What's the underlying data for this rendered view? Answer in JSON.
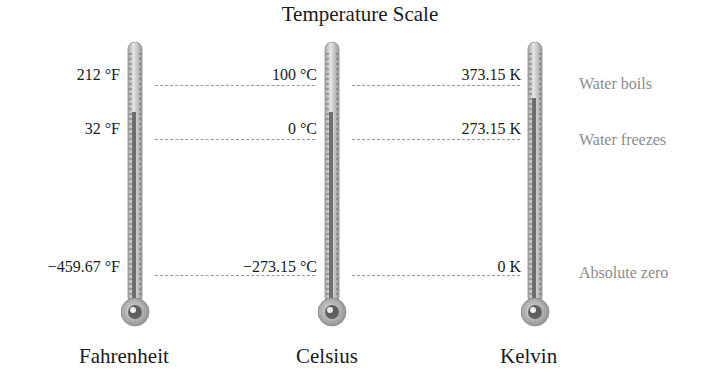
{
  "title": "Temperature Scale",
  "scales": [
    {
      "name": "Fahrenheit",
      "boils": "212 °F",
      "freezes": "32 °F",
      "zero": "−459.67 °F"
    },
    {
      "name": "Celsius",
      "boils": "100 °C",
      "freezes": "0 °C",
      "zero": "−273.15 °C"
    },
    {
      "name": "Kelvin",
      "boils": "373.15 K",
      "freezes": "273.15 K",
      "zero": "0 K"
    }
  ],
  "notes": {
    "boils": "Water boils",
    "freezes": "Water freezes",
    "zero": "Absolute zero"
  },
  "colors": {
    "note_text": "#8c8c8c",
    "dash": "#9a9a9a",
    "tube": "#c8c8c8",
    "mercury": "#7a7a7a"
  }
}
